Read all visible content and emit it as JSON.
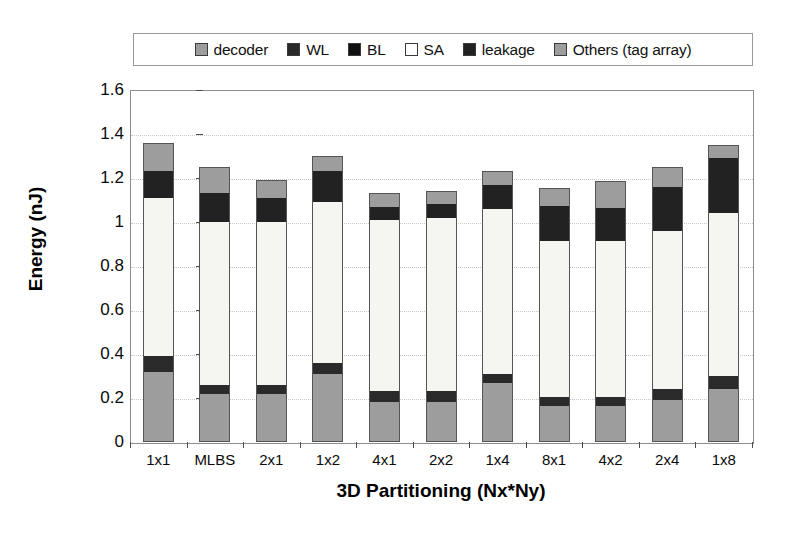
{
  "chart_data": {
    "type": "bar",
    "subtype": "stacked-bar",
    "title": "",
    "xlabel": "3D Partitioning (Nx*Ny)",
    "ylabel": "Energy (nJ)",
    "ylim": [
      0,
      1.6
    ],
    "ytick_step": 0.2,
    "ytick_labels": [
      "1.6",
      "1.4",
      "1.2",
      "1",
      "0.8",
      "0.6",
      "0.4",
      "0.2",
      "0"
    ],
    "ytick_values": [
      1.6,
      1.4,
      1.2,
      1.0,
      0.8,
      0.6,
      0.4,
      0.2,
      0
    ],
    "grid": "horizontal-dotted",
    "legend_position": "top-center",
    "categories": [
      "1x1",
      "MLBS",
      "2x1",
      "1x2",
      "4x1",
      "2x2",
      "1x4",
      "8x1",
      "4x2",
      "2x4",
      "1x8"
    ],
    "series": [
      {
        "name": "decoder",
        "color": "#9d9d9d",
        "values": [
          0.32,
          0.22,
          0.22,
          0.31,
          0.18,
          0.18,
          0.27,
          0.165,
          0.165,
          0.19,
          0.24
        ]
      },
      {
        "name": "WL",
        "color": "#2a2a2a",
        "values": [
          0.07,
          0.04,
          0.04,
          0.05,
          0.05,
          0.05,
          0.04,
          0.04,
          0.04,
          0.05,
          0.06
        ]
      },
      {
        "name": "BL",
        "color": "#1a1a1a",
        "values": [
          0.0,
          0.0,
          0.0,
          0.0,
          0.0,
          0.0,
          0.0,
          0.0,
          0.0,
          0.0,
          0.0
        ]
      },
      {
        "name": "SA",
        "color": "#f5f5f2",
        "values": [
          0.72,
          0.74,
          0.74,
          0.73,
          0.78,
          0.79,
          0.75,
          0.71,
          0.71,
          0.72,
          0.74
        ]
      },
      {
        "name": "leakage",
        "color": "#222222",
        "values": [
          0.12,
          0.13,
          0.11,
          0.14,
          0.06,
          0.06,
          0.11,
          0.16,
          0.15,
          0.2,
          0.25
        ]
      },
      {
        "name": "Others (tag array)",
        "color": "#9d9d9d",
        "values": [
          0.13,
          0.12,
          0.08,
          0.07,
          0.06,
          0.06,
          0.06,
          0.08,
          0.12,
          0.09,
          0.06
        ]
      }
    ],
    "totals": [
      1.36,
      1.245,
      1.19,
      1.29,
      1.13,
      1.14,
      1.23,
      1.155,
      1.185,
      1.25,
      1.35
    ]
  },
  "legend": {
    "items": [
      {
        "label": "decoder",
        "color": "#9d9d9d"
      },
      {
        "label": "WL",
        "color": "#2a2a2a"
      },
      {
        "label": "BL",
        "color": "#111111"
      },
      {
        "label": "SA",
        "color": "#ffffff"
      },
      {
        "label": "leakage",
        "color": "#222222"
      },
      {
        "label": "Others (tag array)",
        "color": "#9d9d9d"
      }
    ]
  },
  "axes": {
    "y_title": "Energy (nJ)",
    "x_title": "3D Partitioning (Nx*Ny)"
  }
}
